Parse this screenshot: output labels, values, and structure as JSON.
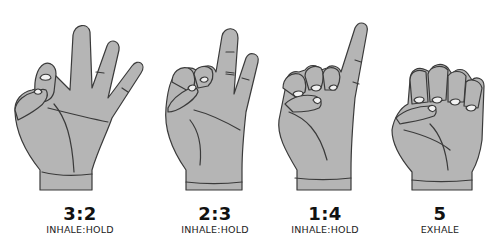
{
  "colors": {
    "background": "#ffffff",
    "hand_fill": "#b5b5b5",
    "outline": "#3a3a3a",
    "nail": "#f2f2f2",
    "text": "#111111"
  },
  "gestures": [
    {
      "ratio": "3:2",
      "label": "INHALE:HOLD",
      "icon": "hand-thumb-to-pinky-icon"
    },
    {
      "ratio": "2:3",
      "label": "INHALE:HOLD",
      "icon": "hand-thumb-to-ring-pinky-icon"
    },
    {
      "ratio": "1:4",
      "label": "INHALE:HOLD",
      "icon": "hand-thumb-to-middle-ring-pinky-icon"
    },
    {
      "ratio": "5",
      "label": "EXHALE",
      "icon": "hand-fist-icon"
    }
  ]
}
